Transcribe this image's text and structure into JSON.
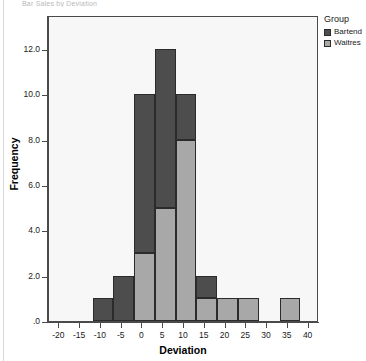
{
  "title_strip": "Bar Sales by Deviation",
  "legend": {
    "title": "Group",
    "entries": [
      {
        "label": "Bartend",
        "color": "#4d4d4d"
      },
      {
        "label": "Waitres",
        "color": "#a8a8a8"
      }
    ]
  },
  "chart_data": {
    "type": "bar",
    "title": "",
    "xlabel": "Deviation",
    "ylabel": "Frequency",
    "xlim": [
      -22.5,
      42.5
    ],
    "ylim": [
      0,
      13.5
    ],
    "grid": false,
    "legend_position": "right",
    "stacked": true,
    "bin_width": 5,
    "xticks": [
      "-20",
      "-15",
      "-10",
      "-5",
      "0",
      "5",
      "10",
      "15",
      "20",
      "25",
      "30",
      "35",
      "40"
    ],
    "xtick_values": [
      -20,
      -15,
      -10,
      -5,
      0,
      5,
      10,
      15,
      20,
      25,
      30,
      35,
      40
    ],
    "yticks": [
      ".0",
      "2.0",
      "4.0",
      "6.0",
      "8.0",
      "10.0",
      "12.0"
    ],
    "ytick_values": [
      0,
      2,
      4,
      6,
      8,
      10,
      12
    ],
    "bins": [
      {
        "x0": -12,
        "x1": -7,
        "bartend": 1,
        "waitres": 0
      },
      {
        "x0": -7,
        "x1": -2,
        "bartend": 2,
        "waitres": 0
      },
      {
        "x0": -2,
        "x1": 3,
        "bartend": 7,
        "waitres": 3
      },
      {
        "x0": 3,
        "x1": 8,
        "bartend": 7,
        "waitres": 5
      },
      {
        "x0": 8,
        "x1": 13,
        "bartend": 2,
        "waitres": 8
      },
      {
        "x0": 13,
        "x1": 18,
        "bartend": 1,
        "waitres": 1
      },
      {
        "x0": 18,
        "x1": 23,
        "bartend": 0,
        "waitres": 1
      },
      {
        "x0": 23,
        "x1": 28,
        "bartend": 0,
        "waitres": 1
      },
      {
        "x0": 33,
        "x1": 38,
        "bartend": 0,
        "waitres": 1
      }
    ],
    "series": [
      {
        "name": "Bartend",
        "color": "#4d4d4d",
        "values": [
          1,
          2,
          7,
          7,
          2,
          1,
          0,
          0,
          0
        ]
      },
      {
        "name": "Waitres",
        "color": "#a8a8a8",
        "values": [
          0,
          0,
          3,
          5,
          8,
          1,
          1,
          1,
          1
        ]
      }
    ]
  }
}
